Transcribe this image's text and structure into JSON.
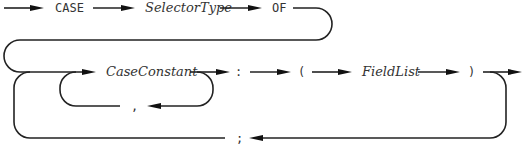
{
  "diagram": {
    "kind": "syntax-railroad-diagram",
    "rule": "variant record CASE part",
    "tokens": {
      "case_kw": "CASE",
      "selector_type": "SelectorType",
      "of_kw": "OF",
      "case_constant": "CaseConstant",
      "comma": ",",
      "colon": ":",
      "lparen": "(",
      "field_list": "FieldList",
      "rparen": ")",
      "semicolon": ";"
    },
    "token_styles": {
      "keywords": [
        "CASE",
        "OF"
      ],
      "nonterminals": [
        "SelectorType",
        "CaseConstant",
        "FieldList"
      ],
      "punctuation": [
        ",",
        ":",
        "(",
        ")",
        ";"
      ]
    },
    "loops": [
      {
        "name": "constant-list-loop",
        "repeats": "CaseConstant",
        "separator": ","
      },
      {
        "name": "variant-loop",
        "repeats": "CaseConstant-list : ( FieldList )",
        "separator": ";"
      }
    ],
    "colors": {
      "line": "#222222",
      "text": "#333333",
      "background": "#ffffff"
    }
  }
}
